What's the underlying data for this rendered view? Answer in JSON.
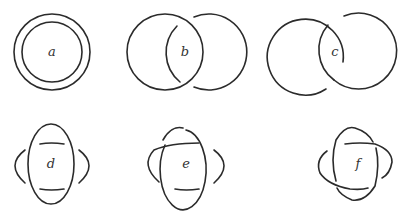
{
  "figure": {
    "background": "#ffffff",
    "stroke_color": "#2b2b2b",
    "panels": [
      {
        "id": "a",
        "label": "a",
        "description": "unlink: two concentric circles"
      },
      {
        "id": "b",
        "label": "b",
        "description": "two overlapping circles, one strand passing over"
      },
      {
        "id": "c",
        "label": "c",
        "description": "Hopf link: two linked circles"
      },
      {
        "id": "d",
        "label": "d",
        "description": "vertical ellipse with two horizontal arcs and two side arcs, no crossings"
      },
      {
        "id": "e",
        "label": "e",
        "description": "ellipse with one arc crossing over"
      },
      {
        "id": "f",
        "label": "f",
        "description": "ellipse and arcs forming alternating crossings"
      }
    ]
  }
}
